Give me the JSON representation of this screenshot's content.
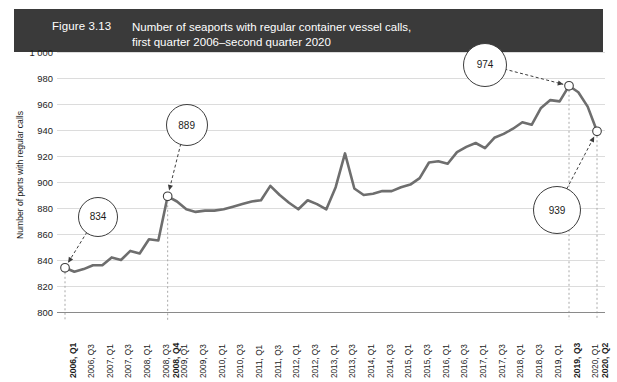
{
  "figure": {
    "number": "Figure 3.13",
    "title_line1": "Number of seaports with regular container vessel calls,",
    "title_line2": "first quarter 2006–second quarter 2020",
    "header_bg": "#3a3a3a",
    "header_fg": "#ffffff"
  },
  "chart_data": {
    "type": "line",
    "title": "Number of seaports with regular container vessel calls, first quarter 2006–second quarter 2020",
    "xlabel": "",
    "ylabel": "Number of ports with regular calls",
    "ylim": [
      800,
      1000
    ],
    "ytick_labels": [
      "1 000",
      "980",
      "960",
      "940",
      "920",
      "900",
      "880",
      "860",
      "840",
      "820",
      "800"
    ],
    "ytick_values": [
      1000,
      980,
      960,
      940,
      920,
      900,
      880,
      860,
      840,
      820,
      800
    ],
    "grid": true,
    "legend": "none",
    "line_color": "#6e6e6e",
    "categories": [
      "2006, Q1",
      "2006, Q2",
      "2006, Q3",
      "2006, Q4",
      "2007, Q1",
      "2007, Q2",
      "2007, Q3",
      "2007, Q4",
      "2008, Q1",
      "2008, Q2",
      "2008, Q3",
      "2008, Q4",
      "2009, Q1",
      "2009, Q2",
      "2009, Q3",
      "2009, Q4",
      "2010, Q1",
      "2010, Q2",
      "2010, Q3",
      "2010, Q4",
      "2011, Q1",
      "2011, Q2",
      "2011, Q3",
      "2011, Q4",
      "2012, Q1",
      "2012, Q2",
      "2012, Q3",
      "2012, Q4",
      "2013, Q1",
      "2013, Q2",
      "2013, Q3",
      "2013, Q4",
      "2014, Q1",
      "2014, Q2",
      "2014, Q3",
      "2014, Q4",
      "2015, Q1",
      "2015, Q2",
      "2015, Q3",
      "2015, Q4",
      "2016, Q1",
      "2016, Q2",
      "2016, Q3",
      "2016, Q4",
      "2017, Q1",
      "2017, Q2",
      "2017, Q3",
      "2017, Q4",
      "2018, Q1",
      "2018, Q2",
      "2018, Q3",
      "2018, Q4",
      "2019, Q1",
      "2019, Q2",
      "2019, Q3",
      "2019, Q4",
      "2020, Q1",
      "2020, Q2"
    ],
    "xtick_labels": [
      {
        "label": "2006, Q1",
        "index": 0,
        "bold": true
      },
      {
        "label": "2006, Q3",
        "index": 2,
        "bold": false
      },
      {
        "label": "2007, Q1",
        "index": 4,
        "bold": false
      },
      {
        "label": "2007, Q3",
        "index": 6,
        "bold": false
      },
      {
        "label": "2008, Q1",
        "index": 8,
        "bold": false
      },
      {
        "label": "2008, Q3",
        "index": 10,
        "bold": false
      },
      {
        "label": "2008, Q4",
        "index": 11,
        "bold": true
      },
      {
        "label": "2009, Q1",
        "index": 12,
        "bold": false
      },
      {
        "label": "2009, Q3",
        "index": 14,
        "bold": false
      },
      {
        "label": "2010, Q1",
        "index": 16,
        "bold": false
      },
      {
        "label": "2010, Q3",
        "index": 18,
        "bold": false
      },
      {
        "label": "2011, Q1",
        "index": 20,
        "bold": false
      },
      {
        "label": "2011, Q3",
        "index": 22,
        "bold": false
      },
      {
        "label": "2012, Q1",
        "index": 24,
        "bold": false
      },
      {
        "label": "2012, Q3",
        "index": 26,
        "bold": false
      },
      {
        "label": "2013, Q1",
        "index": 28,
        "bold": false
      },
      {
        "label": "2013, Q3",
        "index": 30,
        "bold": false
      },
      {
        "label": "2014, Q1",
        "index": 32,
        "bold": false
      },
      {
        "label": "2014, Q3",
        "index": 34,
        "bold": false
      },
      {
        "label": "2015, Q1",
        "index": 36,
        "bold": false
      },
      {
        "label": "2015, Q3",
        "index": 38,
        "bold": false
      },
      {
        "label": "2016, Q1",
        "index": 40,
        "bold": false
      },
      {
        "label": "2016, Q3",
        "index": 42,
        "bold": false
      },
      {
        "label": "2017, Q1",
        "index": 44,
        "bold": false
      },
      {
        "label": "2017, Q3",
        "index": 46,
        "bold": false
      },
      {
        "label": "2018, Q1",
        "index": 48,
        "bold": false
      },
      {
        "label": "2018, Q3",
        "index": 50,
        "bold": false
      },
      {
        "label": "2019, Q1",
        "index": 52,
        "bold": false
      },
      {
        "label": "2019, Q3",
        "index": 54,
        "bold": true
      },
      {
        "label": "2020, Q1",
        "index": 56,
        "bold": false
      },
      {
        "label": "2020, Q2",
        "index": 57,
        "bold": true
      }
    ],
    "values": [
      834,
      831,
      833,
      836,
      836,
      842,
      840,
      847,
      845,
      856,
      855,
      889,
      885,
      879,
      877,
      878,
      878,
      879,
      881,
      883,
      885,
      886,
      897,
      890,
      884,
      879,
      886,
      883,
      879,
      896,
      922,
      895,
      890,
      891,
      893,
      893,
      896,
      898,
      903,
      915,
      916,
      914,
      923,
      927,
      930,
      926,
      934,
      937,
      941,
      946,
      944,
      957,
      963,
      962,
      974,
      969,
      958,
      939
    ],
    "annotations": [
      {
        "label": "834",
        "point_index": 0,
        "value": 834
      },
      {
        "label": "889",
        "point_index": 11,
        "value": 889
      },
      {
        "label": "974",
        "point_index": 54,
        "value": 974
      },
      {
        "label": "939",
        "point_index": 57,
        "value": 939
      }
    ]
  }
}
